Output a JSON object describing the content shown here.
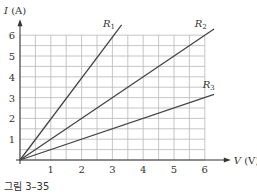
{
  "caption": "그림 3–35",
  "chart_data": {
    "type": "line",
    "title": "",
    "xlabel": "V (V)",
    "ylabel": "I (A)",
    "xlim": [
      0,
      6
    ],
    "ylim": [
      0,
      6
    ],
    "xticks": [
      "1",
      "2",
      "3",
      "4",
      "5",
      "6"
    ],
    "yticks": [
      "1",
      "2",
      "3",
      "4",
      "5",
      "6"
    ],
    "grid": true,
    "grid_step": 0.5,
    "series": [
      {
        "name": "R1",
        "x": [
          0,
          3.3
        ],
        "y": [
          0,
          6.5
        ],
        "slope": 2.0
      },
      {
        "name": "R2",
        "x": [
          0,
          6.3
        ],
        "y": [
          0,
          6.3
        ],
        "slope": 1.0
      },
      {
        "name": "R3",
        "x": [
          0,
          6.3
        ],
        "y": [
          0,
          3.15
        ],
        "slope": 0.5
      }
    ],
    "line_color": "#444444",
    "grid_color": "#b8b8b8"
  }
}
